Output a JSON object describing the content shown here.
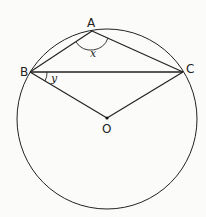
{
  "diagram": {
    "type": "circle-geometry",
    "points": {
      "A": {
        "label": "A"
      },
      "B": {
        "label": "B"
      },
      "C": {
        "label": "C"
      },
      "O": {
        "label": "O"
      }
    },
    "angles": {
      "x": {
        "label": "x",
        "at": "A"
      },
      "y": {
        "label": "y",
        "at": "B"
      }
    },
    "colors": {
      "stroke": "#222222",
      "background": "#fbfbfa"
    }
  }
}
